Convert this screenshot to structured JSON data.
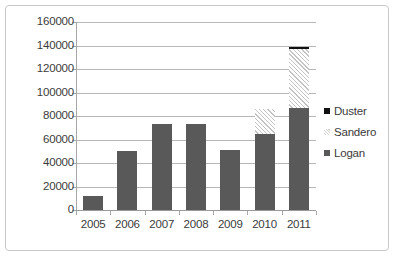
{
  "chart_data": {
    "type": "bar",
    "stacked": true,
    "title": "",
    "xlabel": "",
    "ylabel": "",
    "categories": [
      "2005",
      "2006",
      "2007",
      "2008",
      "2009",
      "2010",
      "2011"
    ],
    "series": [
      {
        "name": "Logan",
        "values": [
          12000,
          50500,
          73000,
          73500,
          51000,
          65000,
          86500
        ],
        "color": "#595959",
        "pattern": "solid"
      },
      {
        "name": "Sandero",
        "values": [
          0,
          0,
          0,
          0,
          0,
          21000,
          50500
        ],
        "color": "#ffffff",
        "pattern": "diagonal-hatch"
      },
      {
        "name": "Duster",
        "values": [
          0,
          0,
          0,
          0,
          0,
          0,
          1500
        ],
        "color": "#111111",
        "pattern": "solid"
      }
    ],
    "ylim": [
      0,
      160000
    ],
    "ytick_labels": [
      "160000",
      "140000",
      "120000",
      "100000",
      "80000",
      "60000",
      "40000",
      "20000",
      "0"
    ],
    "ytick_values": [
      160000,
      140000,
      120000,
      100000,
      80000,
      60000,
      40000,
      20000,
      0
    ],
    "grid": true,
    "legend_position": "right",
    "legend_order": [
      "Duster",
      "Sandero",
      "Logan"
    ]
  },
  "legend": {
    "items": [
      {
        "label": "Duster"
      },
      {
        "label": "Sandero"
      },
      {
        "label": "Logan"
      }
    ]
  }
}
